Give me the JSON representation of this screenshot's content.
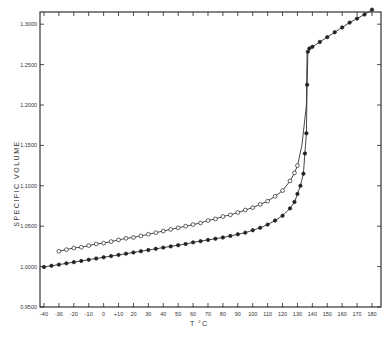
{
  "chart_data": {
    "type": "line",
    "title": "",
    "xlabel": "T °C",
    "ylabel": "SPECIFIC   VOLUME",
    "xlim": [
      -40,
      185
    ],
    "ylim": [
      0.95,
      1.32
    ],
    "grid": false,
    "legend": null,
    "x_ticks": [
      -40,
      -30,
      -20,
      -10,
      0,
      10,
      20,
      30,
      40,
      50,
      60,
      70,
      80,
      90,
      100,
      110,
      120,
      130,
      140,
      150,
      160,
      170,
      180
    ],
    "x_tick_labels": [
      "-40",
      "-30",
      "-20",
      "-10",
      "0",
      "+10",
      "20",
      "30",
      "40",
      "50",
      "60",
      "70",
      "80",
      "90",
      "100",
      "110",
      "120",
      "130",
      "140",
      "150",
      "160",
      "170",
      "180"
    ],
    "y_ticks": [
      0.95,
      1.0,
      1.05,
      1.1,
      1.15,
      1.2,
      1.25,
      1.3
    ],
    "y_tick_labels": [
      "0.9500",
      "1.0000",
      "1.0500",
      "1.1000",
      "1.1500",
      "1.2000",
      "1.2500",
      "1.3000"
    ],
    "series": [
      {
        "name": "open circles (quenched)",
        "marker": "open-circle",
        "x": [
          -30,
          -25,
          -20,
          -15,
          -10,
          -5,
          0,
          5,
          10,
          15,
          20,
          25,
          30,
          35,
          40,
          45,
          50,
          55,
          60,
          65,
          70,
          75,
          80,
          85,
          90,
          95,
          100,
          105,
          110,
          115,
          120,
          125,
          128,
          130
        ],
        "y": [
          1.019,
          1.021,
          1.023,
          1.024,
          1.026,
          1.028,
          1.029,
          1.031,
          1.033,
          1.035,
          1.036,
          1.038,
          1.04,
          1.042,
          1.044,
          1.046,
          1.048,
          1.05,
          1.052,
          1.054,
          1.057,
          1.059,
          1.062,
          1.064,
          1.067,
          1.07,
          1.073,
          1.077,
          1.081,
          1.087,
          1.094,
          1.106,
          1.116,
          1.125
        ]
      },
      {
        "name": "filled circles (annealed)",
        "marker": "filled-circle",
        "x": [
          -40,
          -35,
          -30,
          -25,
          -20,
          -15,
          -10,
          -5,
          0,
          5,
          10,
          15,
          20,
          25,
          30,
          35,
          40,
          45,
          50,
          55,
          60,
          65,
          70,
          75,
          80,
          85,
          90,
          95,
          100,
          105,
          110,
          115,
          120,
          125,
          128,
          130,
          132,
          134,
          135,
          136,
          136.5,
          137,
          138,
          140,
          145,
          150,
          155,
          160,
          165,
          170,
          175,
          180
        ],
        "y": [
          0.9995,
          1.001,
          1.0025,
          1.004,
          1.0055,
          1.007,
          1.0085,
          1.01,
          1.0115,
          1.013,
          1.0145,
          1.016,
          1.0175,
          1.019,
          1.0205,
          1.022,
          1.0235,
          1.025,
          1.0265,
          1.028,
          1.03,
          1.0315,
          1.033,
          1.0345,
          1.036,
          1.038,
          1.04,
          1.042,
          1.045,
          1.048,
          1.052,
          1.057,
          1.063,
          1.072,
          1.08,
          1.09,
          1.1,
          1.115,
          1.14,
          1.165,
          1.225,
          1.266,
          1.27,
          1.272,
          1.278,
          1.284,
          1.29,
          1.296,
          1.302,
          1.307,
          1.312,
          1.318
        ]
      }
    ]
  }
}
